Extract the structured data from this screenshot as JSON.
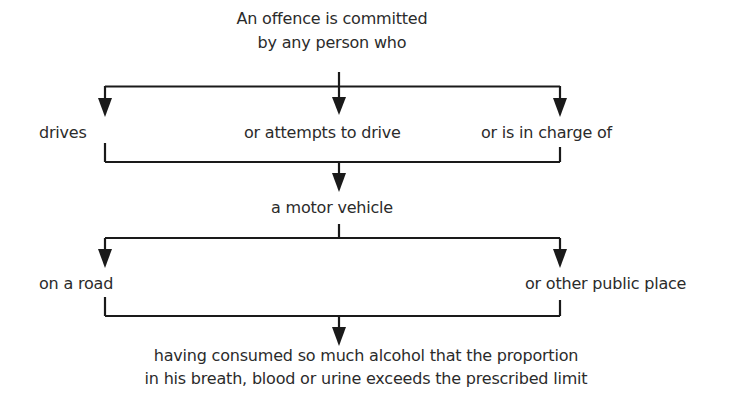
{
  "diagram": {
    "title_line1": "An offence is committed",
    "title_line2": "by any person who",
    "actions": [
      {
        "label": "drives"
      },
      {
        "label": "or attempts to drive"
      },
      {
        "label": "or is in charge of"
      }
    ],
    "object": "a motor vehicle",
    "locations": [
      {
        "label": "on a road"
      },
      {
        "label": "or other public place"
      }
    ],
    "conclusion_line1": "having consumed so much alcohol that the proportion",
    "conclusion_line2": "in his breath, blood or urine exceeds the prescribed limit",
    "colors": {
      "line": "#1a1a1a",
      "text": "#2b2b2b",
      "background": "#ffffff"
    }
  }
}
